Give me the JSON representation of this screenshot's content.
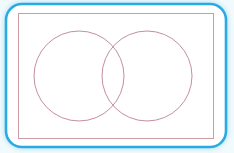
{
  "figure": {
    "type": "venn-diagram",
    "canvas": {
      "width": 234,
      "height": 153,
      "background_color": "#f1fafd"
    },
    "outer_card": {
      "name": "rounded-blue-frame",
      "shape": "rounded-rectangle",
      "x": 6,
      "y": 4,
      "width": 220,
      "height": 143,
      "corner_radius": 16,
      "stroke_color": "#29abe2",
      "stroke_width": 2.6,
      "fill_color": "#ffffff",
      "glow_color": "#bfe6f7"
    },
    "inner_rectangle": {
      "name": "universal-set-rectangle",
      "shape": "rectangle",
      "x": 18,
      "y": 13,
      "width": 195,
      "height": 125,
      "stroke_color": "#cc9ba3",
      "stroke_width": 1,
      "fill_color": "none"
    },
    "circles": [
      {
        "name": "left-set-circle",
        "cx": 79,
        "cy": 76,
        "r": 45,
        "stroke_color": "#c4909a",
        "stroke_width": 1,
        "fill_color": "none"
      },
      {
        "name": "right-set-circle",
        "cx": 147,
        "cy": 76,
        "r": 45,
        "stroke_color": "#c4909a",
        "stroke_width": 1,
        "fill_color": "none"
      }
    ],
    "intersection": {
      "name": "lens-region",
      "top_point_x": 117,
      "top_point_y": 48,
      "bottom_point_x": 117,
      "bottom_point_y": 105,
      "fill_color": "none"
    },
    "labels": []
  }
}
